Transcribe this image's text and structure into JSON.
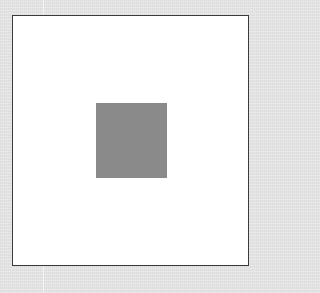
{
  "canvas": {
    "background_color": "#e4e4e4",
    "frame": {
      "fill_color": "#ffffff",
      "border_color": "#3a3a3a"
    },
    "shape": {
      "type": "square",
      "fill_color": "#8a8a8a"
    }
  }
}
